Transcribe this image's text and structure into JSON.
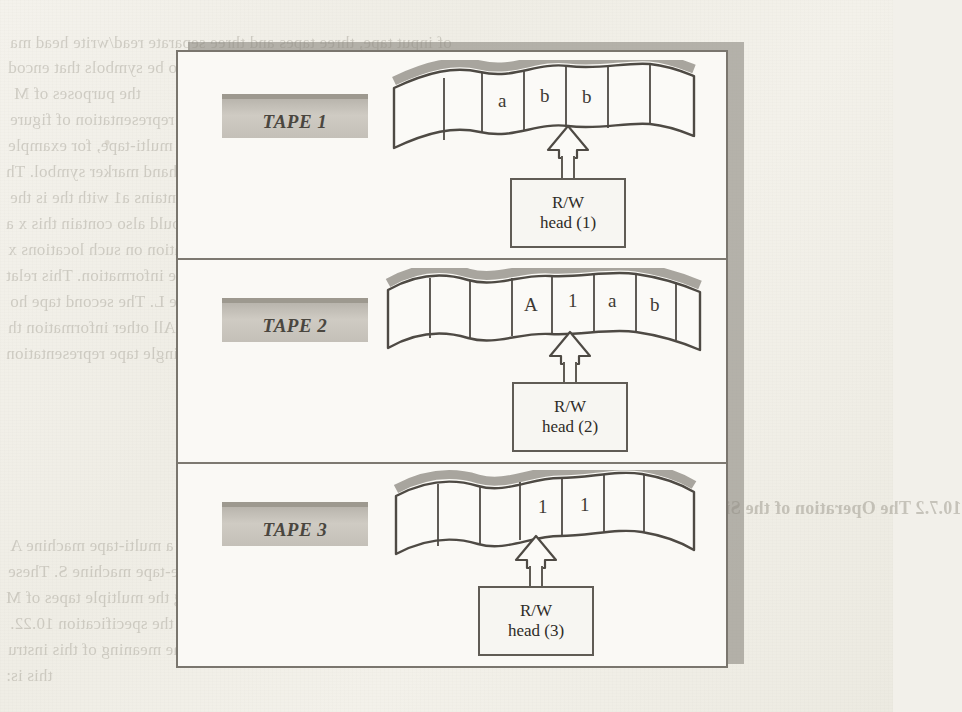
{
  "page": {
    "background_color": "#f2f0ea",
    "ink_color": "#3e3a35"
  },
  "figure": {
    "frame_color": "#7a766e",
    "shadow_color": "#8e8a82",
    "label_plate_color": "#c4c0b8",
    "panels": [
      {
        "tape_label": "TAPE 1",
        "cells": [
          "",
          "",
          "a",
          "b",
          "b",
          ""
        ],
        "head_pointer_cell_index": 3,
        "head_line_1": "R/W",
        "head_line_2": "head (1)"
      },
      {
        "tape_label": "TAPE 2",
        "cells": [
          "",
          "",
          "A",
          "1",
          "a",
          "b"
        ],
        "head_pointer_cell_index": 3,
        "head_line_1": "R/W",
        "head_line_2": "head (2)"
      },
      {
        "tape_label": "TAPE 3",
        "cells": [
          "",
          "",
          "1",
          "1",
          "",
          ""
        ],
        "head_pointer_cell_index": 2,
        "head_line_1": "R/W",
        "head_line_2": "head (3)"
      }
    ]
  },
  "page_text": {
    "bleed_lines": [
      {
        "x": 10,
        "y": 33,
        "size": 17,
        "text": "of input tape, three tapes and three separate read/write head ma"
      },
      {
        "x": 8,
        "y": 58,
        "size": 17,
        "text": "heads 1, 2 and 3 respectively) are required to be symbols that encod"
      },
      {
        "x": 14,
        "y": 84,
        "size": 17,
        "text": "the purposes of M"
      },
      {
        "x": 10,
        "y": 110,
        "size": 17,
        "text": "the encoding of the three tapes as a single tape representation of figure"
      },
      {
        "x": 8,
        "y": 136,
        "size": 17,
        "text": "it carries all of the information of the original multi-tape, for example"
      },
      {
        "x": 6,
        "y": 162,
        "size": 17,
        "text": "locks on this second tape squares to the right of the left hand marker symbol. Th"
      },
      {
        "x": 10,
        "y": 188,
        "size": 17,
        "text": "however is the second occurrence of the a2 = e1 1, i.e. 1.1 contains a1 with the is the"
      },
      {
        "x": 6,
        "y": 214,
        "size": 17,
        "text": "the second tape. Consequently the record of tape L of M should also contain this x a"
      },
      {
        "x": 8,
        "y": 240,
        "size": 17,
        "text": "tape 1. Moreover, the square to the right of the information on such locations x"
      },
      {
        "x": 6,
        "y": 266,
        "size": 17,
        "text": "the machine head is scanning the square containing a2 of the information. This relat"
      },
      {
        "x": 10,
        "y": 292,
        "size": 17,
        "text": "is in the respective square of the information which is on tape L. The second tape ho"
      },
      {
        "x": 8,
        "y": 318,
        "size": 17,
        "text": "contains a blank in the list of the information it holds. All other information th"
      },
      {
        "x": 6,
        "y": 344,
        "size": 17,
        "text": "initial three tapes can be seen to be recovered from our single tape representation"
      }
    ],
    "bleed_lines_right": [
      {
        "x": 470,
        "y": 110,
        "size": 17,
        "text": "of M"
      },
      {
        "x": 448,
        "y": 136,
        "size": 17,
        "text": "s of the three tapes as a single"
      },
      {
        "x": 444,
        "y": 162,
        "size": 17,
        "text": "all of the information of the"
      },
      {
        "x": 436,
        "y": 188,
        "size": 17,
        "text": "cks on this second tape, square"
      },
      {
        "x": 438,
        "y": 214,
        "size": 17,
        "text": "however is the second occu"
      }
    ],
    "lower_heading": "10.7.2  The Operation of the Single Tape Machine A",
    "lower_lines": [
      {
        "x": 10,
        "y": 536,
        "size": 17,
        "text": "of the machine S simulating a multi-tape machine A"
      },
      {
        "x": 8,
        "y": 562,
        "size": 17,
        "text": "become several instructions (programs) of the single-tape machine S.  These"
      },
      {
        "x": 6,
        "y": 588,
        "size": 17,
        "text": "corresponding operate on a single tape with order resembling the multiple tapes of M"
      },
      {
        "x": 10,
        "y": 614,
        "size": 17,
        "text": "in the specification 10.22."
      },
      {
        "x": 8,
        "y": 640,
        "size": 17,
        "text": "Consider as a simple example, a triple (1 , a1, b , 2).  The meaning of this instru"
      },
      {
        "x": 6,
        "y": 666,
        "size": 17,
        "text": "this is:"
      }
    ]
  }
}
